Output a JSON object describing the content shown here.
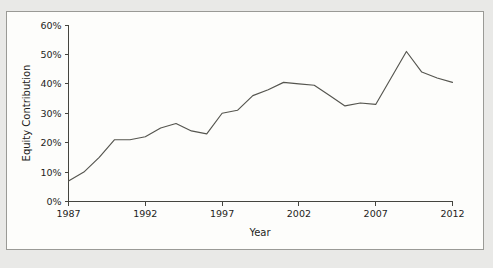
{
  "figure": {
    "background_color": "#fdfdfb",
    "page_background_color": "#e9e9e7",
    "border_color": "#9a9a96",
    "line_color": "#55554f"
  },
  "chart_data": {
    "type": "line",
    "title": "",
    "xlabel": "Year",
    "ylabel": "Equity Contribution",
    "xlim": [
      1987,
      2012
    ],
    "ylim": [
      0,
      60
    ],
    "grid": false,
    "legend": "none",
    "x_tick_labels": [
      "1987",
      "1992",
      "1997",
      "2002",
      "2007",
      "2012"
    ],
    "x_tick_values": [
      1987,
      1992,
      1997,
      2002,
      2007,
      2012
    ],
    "y_tick_labels": [
      "0%",
      "10%",
      "20%",
      "30%",
      "40%",
      "50%",
      "60%"
    ],
    "y_tick_values": [
      0,
      10,
      20,
      30,
      40,
      50,
      60
    ],
    "x": [
      1987,
      1988,
      1989,
      1990,
      1991,
      1992,
      1993,
      1994,
      1995,
      1996,
      1997,
      1998,
      1999,
      2000,
      2001,
      2002,
      2003,
      2004,
      2005,
      2006,
      2007,
      2008,
      2009,
      2010,
      2011,
      2012
    ],
    "series": [
      {
        "name": "Equity Contribution",
        "values": [
          7,
          10,
          15,
          21,
          21,
          22,
          25,
          26.5,
          24,
          23,
          30,
          31,
          36,
          38,
          40.5,
          40,
          39.5,
          36,
          32.5,
          33.5,
          33,
          42,
          51,
          44,
          42,
          40.5
        ]
      }
    ]
  }
}
